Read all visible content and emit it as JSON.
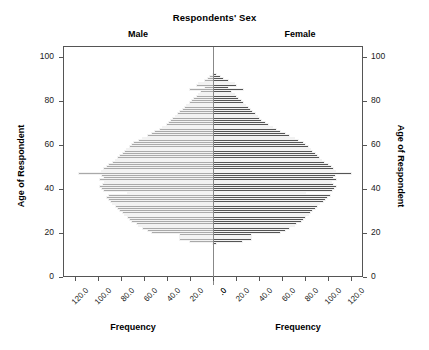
{
  "chart": {
    "title": "Respondents' Sex",
    "panels": [
      {
        "key": "male",
        "label": "Male"
      },
      {
        "key": "female",
        "label": "Female"
      }
    ],
    "xlabel_left": "Frequency",
    "xlabel_right": "Frequency",
    "ylabel_left": "Age of Respondent",
    "ylabel_right": "Age of Respondent",
    "y_ticks": [
      "0",
      "20",
      "40",
      "60",
      "80",
      "100"
    ],
    "x_ticks_left": [
      "120.0",
      "100.0",
      "80.0",
      "60.0",
      "40.0",
      "20.0",
      ".0"
    ],
    "x_ticks_right": [
      ".0",
      "20.0",
      "40.0",
      "60.0",
      "80.0",
      "100.0",
      "120.0"
    ],
    "colors": {
      "male_bar": "#a9a9a9",
      "female_bar": "#555555",
      "frame": "#555555",
      "divider": "#888888",
      "background": "#ffffff"
    }
  },
  "chart_data": {
    "type": "bar",
    "orientation": "horizontal",
    "subtype": "population-pyramid",
    "title": "Respondents' Sex",
    "xlabel": "Frequency",
    "ylabel": "Age of Respondent",
    "ylim": [
      0,
      105
    ],
    "xlim": [
      0,
      130
    ],
    "grid": false,
    "legend": "panel-titles",
    "categories": [
      15,
      16,
      17,
      18,
      19,
      20,
      21,
      22,
      23,
      24,
      25,
      26,
      27,
      28,
      29,
      30,
      31,
      32,
      33,
      34,
      35,
      36,
      37,
      38,
      39,
      40,
      41,
      42,
      43,
      44,
      45,
      46,
      47,
      48,
      49,
      50,
      51,
      52,
      53,
      54,
      55,
      56,
      57,
      58,
      59,
      60,
      61,
      62,
      63,
      64,
      65,
      66,
      67,
      68,
      69,
      70,
      71,
      72,
      73,
      74,
      75,
      76,
      77,
      78,
      79,
      80,
      81,
      82,
      83,
      84,
      85,
      86,
      87,
      88,
      89,
      90,
      91,
      92
    ],
    "series": [
      {
        "name": "Male",
        "direction": "left",
        "color": "#a9a9a9",
        "values": [
          2,
          22,
          30,
          30,
          30,
          55,
          58,
          62,
          66,
          68,
          72,
          74,
          75,
          78,
          80,
          82,
          84,
          86,
          88,
          90,
          92,
          94,
          92,
          75,
          96,
          98,
          100,
          97,
          95,
          100,
          96,
          98,
          118,
          98,
          96,
          94,
          92,
          88,
          86,
          84,
          82,
          80,
          78,
          76,
          74,
          72,
          70,
          66,
          62,
          58,
          55,
          52,
          48,
          45,
          42,
          40,
          38,
          36,
          34,
          32,
          30,
          28,
          26,
          24,
          22,
          20,
          18,
          16,
          14,
          12,
          22,
          9,
          16,
          14,
          9,
          6,
          4,
          2
        ]
      },
      {
        "name": "Female",
        "direction": "right",
        "color": "#555555",
        "values": [
          3,
          25,
          33,
          33,
          33,
          58,
          62,
          66,
          70,
          72,
          76,
          78,
          80,
          82,
          84,
          86,
          88,
          90,
          92,
          95,
          97,
          99,
          101,
          80,
          103,
          105,
          107,
          104,
          102,
          107,
          104,
          106,
          120,
          106,
          104,
          102,
          100,
          96,
          94,
          92,
          90,
          88,
          86,
          84,
          82,
          80,
          78,
          74,
          70,
          66,
          62,
          58,
          55,
          51,
          48,
          45,
          42,
          40,
          38,
          36,
          34,
          32,
          30,
          28,
          26,
          24,
          22,
          20,
          18,
          16,
          26,
          13,
          20,
          18,
          13,
          9,
          6,
          3
        ]
      }
    ]
  }
}
